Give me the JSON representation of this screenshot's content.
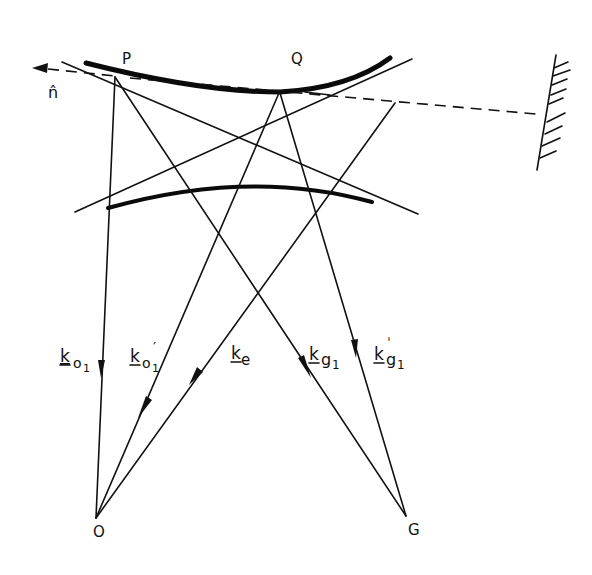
{
  "diagram": {
    "points": {
      "P": "P",
      "Q": "Q",
      "O": "O",
      "G": "G",
      "n_hat": "n̂"
    },
    "vectors": {
      "k_o1": {
        "main": "k",
        "sub": "o",
        "subsub": "1"
      },
      "k_o1_prime": {
        "main": "k",
        "sub": "o",
        "subsub": "1",
        "prime": "′"
      },
      "k_e": {
        "main": "k",
        "sub": "e"
      },
      "k_g1": {
        "main": "k",
        "sub": "g",
        "subsub": "1"
      },
      "k_g1_prime": {
        "main": "k",
        "sub": "g",
        "subsub": "1",
        "prime": "ˈ"
      }
    },
    "colors": {
      "ink": "#111111",
      "background": "#ffffff"
    }
  }
}
